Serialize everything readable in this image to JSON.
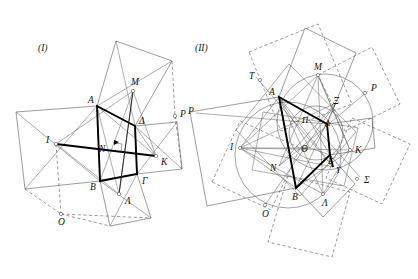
{
  "page": {
    "width": 418,
    "height": 279,
    "background": "#ffffff",
    "ink": "#111111"
  },
  "figures": [
    {
      "id": "figure-1",
      "caption": "(I)",
      "caption_pos": [
        38,
        51
      ],
      "description": "Quadrilateral ABGD with squares erected on its sides; centres M, K, L, I; segments IK and MN drawn bold; auxiliary points O and P at intersections of dashed lines.",
      "quad": {
        "name": "ABGD",
        "vertices": [
          {
            "label": "Α",
            "x": 97,
            "y": 106,
            "label_dx": -9,
            "label_dy": -3
          },
          {
            "label": "Β",
            "x": 100,
            "y": 181,
            "label_dx": -10,
            "label_dy": 9
          },
          {
            "label": "Γ",
            "x": 137,
            "y": 174,
            "label_dx": 5,
            "label_dy": 10
          },
          {
            "label": "Δ",
            "x": 135,
            "y": 126,
            "label_dx": 4,
            "label_dy": -2
          }
        ]
      },
      "centres": [
        {
          "label": "Μ",
          "x": 133,
          "y": 91,
          "label_dx": -2,
          "label_dy": -6
        },
        {
          "label": "Κ",
          "x": 156,
          "y": 156,
          "label_dx": 5,
          "label_dy": 9
        },
        {
          "label": "Λ",
          "x": 119,
          "y": 194,
          "label_dx": 6,
          "label_dy": 10
        },
        {
          "label": "Ι",
          "x": 56,
          "y": 144,
          "label_dx": -10,
          "label_dy": -1
        }
      ],
      "extra_points": [
        {
          "label": "Ν",
          "x": 108,
          "y": 147,
          "label_dx": -9,
          "label_dy": 5
        },
        {
          "label": "Ο",
          "x": 61,
          "y": 214,
          "label_dx": -3,
          "label_dy": 11
        },
        {
          "label": "Ρ",
          "x": 175,
          "y": 116,
          "label_dx": 5,
          "label_dy": 1
        }
      ]
    },
    {
      "id": "figure-2",
      "caption": "(II)",
      "caption_pos": [
        195,
        51
      ],
      "description": "Quadrilateral ABGD with squares on the sides, their centres I, M, K, L, and further squares built on those; circles through the centres; labelled points T, X, P, S, Y, O, N, Th, P, Pi.",
      "quad": {
        "name": "ABGD",
        "vertices": [
          {
            "label": "Α",
            "x": 279,
            "y": 97,
            "label_dx": -9,
            "label_dy": -2
          },
          {
            "label": "Β",
            "x": 296,
            "y": 188,
            "label_dx": -3,
            "label_dy": 11
          },
          {
            "label": "Γ",
            "x": 330,
            "y": 155,
            "label_dx": 1,
            "label_dy": 9
          },
          {
            "label": "Δ",
            "x": 327,
            "y": 124,
            "label_dx": 1,
            "label_dy": 0
          }
        ]
      },
      "centres": [
        {
          "label": "Μ",
          "x": 318,
          "y": 75,
          "label_dx": -2,
          "label_dy": -6
        },
        {
          "label": "Κ",
          "x": 350,
          "y": 150,
          "label_dx": 6,
          "label_dy": 2
        },
        {
          "label": "Λ",
          "x": 323,
          "y": 194,
          "label_dx": 2,
          "label_dy": 11
        },
        {
          "label": "Ι",
          "x": 240,
          "y": 148,
          "label_dx": -10,
          "label_dy": 0
        }
      ],
      "extra_points": [
        {
          "label": "Θ",
          "x": 310,
          "y": 148,
          "label_dx": -9,
          "label_dy": 2
        },
        {
          "label": "Ν",
          "x": 279,
          "y": 166,
          "label_dx": -10,
          "label_dy": 4
        },
        {
          "label": "Π",
          "x": 309,
          "y": 120,
          "label_dx": -8,
          "label_dy": 2
        },
        {
          "label": "Ξ",
          "x": 336,
          "y": 103,
          "label_dx": -1,
          "label_dy": -1
        },
        {
          "label": "Υ",
          "x": 333,
          "y": 167,
          "label_dx": 3,
          "label_dy": 5
        },
        {
          "label": "Τ",
          "x": 256,
          "y": 77,
          "label_dx": -8,
          "label_dy": -1
        },
        {
          "label": "Ρ",
          "x": 368,
          "y": 91,
          "label_dx": 4,
          "label_dy": -1
        },
        {
          "label": "Σ",
          "x": 360,
          "y": 177,
          "label_dx": 6,
          "label_dy": 5
        },
        {
          "label": "Ρ",
          "x": 196,
          "y": 113,
          "label_dx": -8,
          "label_dy": 0
        },
        {
          "label": "Ο",
          "x": 265,
          "y": 205,
          "label_dx": -3,
          "label_dy": 11
        }
      ]
    }
  ],
  "colors": {
    "bold_stroke": "#000000",
    "thin_stroke": "#4a4a4a",
    "dashed_stroke": "#4a4a4a",
    "circle_stroke": "#555555",
    "label_ink": "#111111",
    "background": "#ffffff"
  }
}
